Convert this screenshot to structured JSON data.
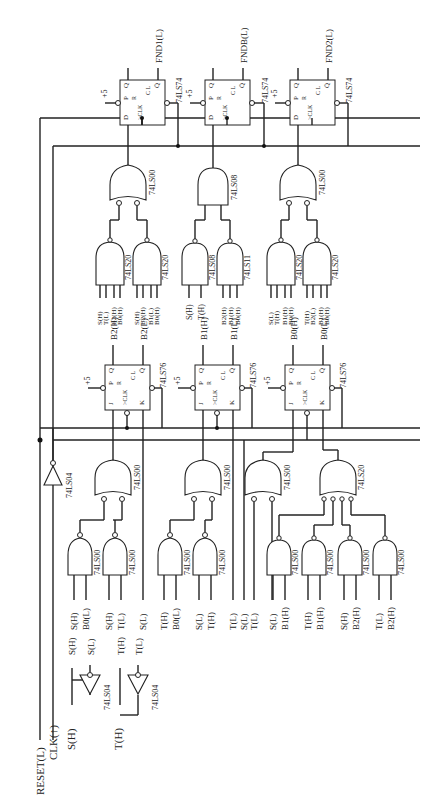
{
  "diagram": {
    "type": "logic-circuit-schematic",
    "orientation": "rotated-90-ccw",
    "inputs": {
      "reset": "RESET(L)",
      "clk": "CLK(↑)",
      "s_in": "S(H)",
      "t_in": "T(H)"
    },
    "input_inverters": [
      {
        "chip": "74LS04",
        "in": "S(H)",
        "out_h": "S(H)",
        "out_l": "S(L)"
      },
      {
        "chip": "74LS04",
        "in": "T(H)",
        "out_h": "T(H)",
        "out_l": "T(L)"
      }
    ],
    "reset_inverter": {
      "chip": "74LS04"
    },
    "jk_flipflops": [
      {
        "id": "B2",
        "chip": "74LS76",
        "pins": [
          "J",
          "P",
          "R",
          "CLK",
          "K",
          "C",
          "L",
          "Q",
          "Q̄"
        ],
        "q": "B2(H)",
        "qbar": "B2(L)",
        "vcc": "+5"
      },
      {
        "id": "B1",
        "chip": "74LS76",
        "pins": [
          "J",
          "P",
          "R",
          "CLK",
          "K",
          "C",
          "L",
          "Q",
          "Q̄"
        ],
        "q": "B1(H)",
        "qbar": "B1(L)",
        "vcc": "+5"
      },
      {
        "id": "B0",
        "chip": "74LS76",
        "pins": [
          "J",
          "P",
          "R",
          "CLK",
          "K",
          "C",
          "L",
          "Q",
          "Q̄"
        ],
        "q": "B0(H)",
        "qbar": "B0(L)",
        "vcc": "+5"
      }
    ],
    "d_flipflops": [
      {
        "id": "FND1",
        "chip": "74LS74",
        "pins": [
          "D",
          "P",
          "R",
          "CLK",
          "C",
          "L",
          "Q",
          "Q̄"
        ],
        "qbar": "FND1(L)",
        "vcc": "+5"
      },
      {
        "id": "FNDB",
        "chip": "74LS74",
        "pins": [
          "D",
          "P",
          "R",
          "CLK",
          "C",
          "L",
          "Q",
          "Q̄"
        ],
        "qbar": "FNDB(L)",
        "vcc": "+5"
      },
      {
        "id": "FND2",
        "chip": "74LS74",
        "pins": [
          "D",
          "P",
          "R",
          "CLK",
          "C",
          "L",
          "Q",
          "Q̄"
        ],
        "qbar": "FND2(L)",
        "vcc": "+5"
      }
    ],
    "j_logic": [
      {
        "target": "B2 J",
        "or_chip": "74LS00",
        "gates": [
          {
            "chip": "74LS00",
            "inputs": [
              "S(H)",
              "B0(L)"
            ]
          },
          {
            "chip": "74LS00",
            "inputs": [
              "S(H)",
              "T(L)"
            ]
          }
        ],
        "k_input": "S(L)"
      },
      {
        "target": "B1 J",
        "or_chip": "74LS00",
        "gates": [
          {
            "chip": "74LS00",
            "inputs": [
              "T(H)",
              "B0(L)"
            ]
          },
          {
            "chip": "74LS00",
            "inputs": [
              "S(L)",
              "T(H)"
            ]
          }
        ],
        "k_input": "T(L)"
      },
      {
        "target": "B0 J",
        "or_chip": "74LS00",
        "direct_inputs": [
          "S(L)",
          "T(L)"
        ],
        "k_chip": "74LS20",
        "k_gates": [
          {
            "chip": "74LS00",
            "inputs": [
              "S(L)",
              "B1(H)"
            ]
          },
          {
            "chip": "74LS00",
            "inputs": [
              "T(H)",
              "B1(H)"
            ]
          },
          {
            "chip": "74LS00",
            "inputs": [
              "S(H)",
              "B2(H)"
            ]
          },
          {
            "chip": "74LS00",
            "inputs": [
              "T(L)",
              "B2(H)"
            ]
          }
        ]
      }
    ],
    "d_logic": [
      {
        "target": "FND1",
        "combine_chip": "74LS00",
        "gates": [
          {
            "chip": "74LS20",
            "inputs": [
              "S(H)",
              "T(L)",
              "B2(H)",
              "B0(H)"
            ]
          },
          {
            "chip": "74LS20",
            "inputs": [
              "S(H)",
              "B2(H)",
              "B1(L)",
              "B0(H)"
            ]
          }
        ]
      },
      {
        "target": "FNDB",
        "combine_chip": "74LS08",
        "gates": [
          {
            "chip": "74LS08",
            "inputs": [
              "S(H)",
              "T(H)"
            ]
          },
          {
            "chip": "74LS11",
            "inputs": [
              "B2(H)",
              "B1(H)",
              "B0(H)"
            ]
          }
        ]
      },
      {
        "target": "FND2",
        "combine_chip": "74LS00",
        "gates": [
          {
            "chip": "74LS20",
            "inputs": [
              "S(L)",
              "T(H)",
              "B1(H)",
              "B0(H)"
            ]
          },
          {
            "chip": "74LS20",
            "inputs": [
              "T(H)",
              "B2(L)",
              "B1(H)",
              "B0(H)"
            ]
          }
        ]
      }
    ]
  }
}
